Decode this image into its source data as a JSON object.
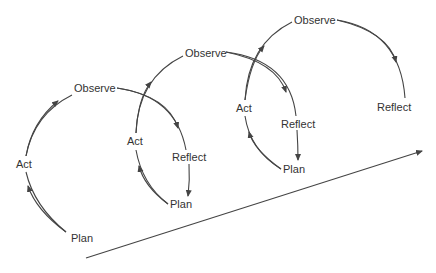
{
  "diagram": {
    "type": "action-research-spiral",
    "stroke_color": "#444444",
    "text_color": "#333333",
    "cycles": [
      {
        "id": 1,
        "labels": {
          "plan": "Plan",
          "act": "Act",
          "observe": "Observe",
          "reflect": "Reflect"
        }
      },
      {
        "id": 2,
        "labels": {
          "plan": "Plan",
          "act": "Act",
          "observe": "Observe",
          "reflect": "Reflect"
        }
      },
      {
        "id": 3,
        "labels": {
          "plan": "Plan",
          "act": "Act",
          "observe": "Observe",
          "reflect": "Reflect"
        }
      }
    ],
    "progress_arrow": {
      "from": [
        86,
        258
      ],
      "to": [
        424,
        150
      ]
    }
  }
}
